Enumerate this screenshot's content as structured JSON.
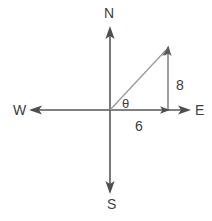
{
  "diagram": {
    "width": 212,
    "height": 221,
    "background_color": "#ffffff",
    "axis_color": "#575757",
    "vector_color": "#9a9a9a",
    "leg_color": "#6b6b6b",
    "text_color": "#3b3b3b",
    "origin": {
      "x": 110,
      "y": 110
    },
    "compass_labels": {
      "north": "N",
      "south": "S",
      "west": "W",
      "east": "E"
    },
    "measures": {
      "vertical_leg": "8",
      "horizontal_leg": "6"
    },
    "angle_label": "θ",
    "axes": {
      "vertical": {
        "x": 110,
        "top_tip_y": 27,
        "bottom_tip_y": 193
      },
      "horizontal": {
        "y": 110,
        "left_tip_x": 30,
        "right_tip_x": 190
      }
    },
    "triangle": {
      "vertex_origin": {
        "x": 110,
        "y": 110
      },
      "vertex_corner": {
        "x": 168,
        "y": 110
      },
      "vertex_tip": {
        "x": 168,
        "y": 47
      }
    },
    "icons": {
      "arrow_north": "arrow-up-icon",
      "arrow_south": "arrow-down-icon",
      "arrow_west": "arrow-left-icon",
      "arrow_east": "arrow-right-icon",
      "arrow_vector": "arrow-diagonal-icon",
      "arrow_leg_vertical": "arrow-up-small-icon",
      "arrow_leg_horizontal": "arrow-right-small-icon"
    }
  }
}
